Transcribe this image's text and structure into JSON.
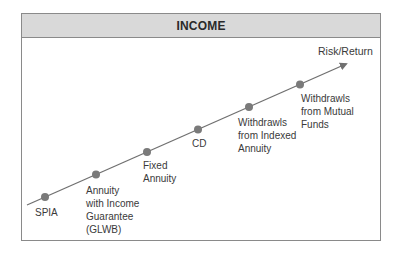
{
  "title": "INCOME",
  "axis_label": "Risk/Return",
  "colors": {
    "header_bg": "#d9d9d9",
    "border": "#8a8a8a",
    "line": "#707070",
    "dot": "#7a7a7a"
  },
  "items": [
    {
      "label_lines": [
        "SPIA"
      ]
    },
    {
      "label_lines": [
        "Annuity",
        "with Income",
        "Guarantee",
        "(GLWB)"
      ]
    },
    {
      "label_lines": [
        "Fixed",
        "Annuity"
      ]
    },
    {
      "label_lines": [
        "CD"
      ]
    },
    {
      "label_lines": [
        "Withdrawls",
        "from Indexed",
        "Annuity"
      ]
    },
    {
      "label_lines": [
        "Withdrawls",
        "from Mutual",
        "Funds"
      ]
    }
  ]
}
